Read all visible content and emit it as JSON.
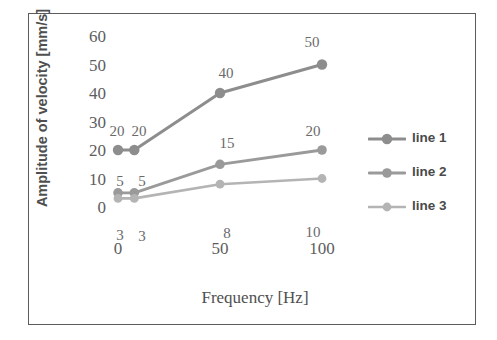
{
  "chart_data": {
    "type": "line",
    "title": "",
    "xlabel": "Frequency [Hz]",
    "ylabel": "Amplitude of velocity [mm/s]",
    "x": [
      0,
      8,
      50,
      100
    ],
    "xtick_labels": [
      "0",
      "50",
      "100"
    ],
    "xtick_values": [
      0,
      50,
      100
    ],
    "ytick_labels": [
      "0",
      "10",
      "20",
      "30",
      "40",
      "50",
      "60"
    ],
    "ytick_values": [
      0,
      10,
      20,
      30,
      40,
      50,
      60
    ],
    "ylim": [
      0,
      60
    ],
    "xlim": [
      0,
      100
    ],
    "grid": false,
    "legend_position": "right",
    "series": [
      {
        "name": "line 1",
        "color": "#8d8d8d",
        "values": [
          20,
          20,
          40,
          50
        ],
        "labels": [
          "20",
          "20",
          "40",
          "50"
        ]
      },
      {
        "name": "line 2",
        "color": "#9a9a9a",
        "values": [
          5,
          5,
          15,
          20
        ],
        "labels": [
          "5",
          "5",
          "15",
          "20"
        ]
      },
      {
        "name": "line 3",
        "color": "#b4b4b4",
        "values": [
          3,
          3,
          8,
          10
        ],
        "labels": [
          "3",
          "3",
          "8",
          "10"
        ]
      }
    ]
  },
  "axes": {
    "y_title": "Amplitude of velocity [mm/s]",
    "x_title": "Frequency [Hz]",
    "y_ticks": [
      "60",
      "50",
      "40",
      "30",
      "20",
      "10",
      "0"
    ],
    "x_ticks": [
      "0",
      "50",
      "100"
    ]
  },
  "legend": {
    "items": [
      {
        "label": "line 1"
      },
      {
        "label": "line 2"
      },
      {
        "label": "line 3"
      }
    ]
  },
  "colors": {
    "frame": "#5c5c5c",
    "line1": "#8d8d8d",
    "line2": "#9a9a9a",
    "line3": "#b4b4b4",
    "text": "#5d5d5d",
    "background": "#ffffff"
  },
  "point_labels": {
    "line1": [
      {
        "text": "20",
        "x": 117,
        "y": 131
      },
      {
        "text": "20",
        "x": 139,
        "y": 131
      },
      {
        "text": "40",
        "x": 226,
        "y": 73
      },
      {
        "text": "50",
        "x": 312,
        "y": 42
      }
    ],
    "line2": [
      {
        "text": "5",
        "x": 120,
        "y": 181
      },
      {
        "text": "5",
        "x": 142,
        "y": 181
      },
      {
        "text": "15",
        "x": 227,
        "y": 143
      },
      {
        "text": "20",
        "x": 313,
        "y": 131
      }
    ],
    "line3": [
      {
        "text": "3",
        "x": 120,
        "y": 235
      },
      {
        "text": "3",
        "x": 142,
        "y": 236
      },
      {
        "text": "8",
        "x": 227,
        "y": 233
      },
      {
        "text": "10",
        "x": 313,
        "y": 232
      }
    ]
  }
}
